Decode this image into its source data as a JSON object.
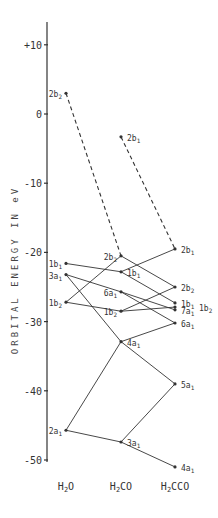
{
  "chart_data": {
    "type": "line",
    "title": "",
    "xlabel": "",
    "ylabel": "ORBITAL ENERGY IN eV",
    "ylim": [
      -52,
      13
    ],
    "yticks": [
      {
        "value": 10,
        "label": "+10"
      },
      {
        "value": 0,
        "label": "0"
      },
      {
        "value": -10,
        "label": "-10"
      },
      {
        "value": -20,
        "label": "-20"
      },
      {
        "value": -30,
        "label": "-30"
      },
      {
        "value": -40,
        "label": "-40"
      },
      {
        "value": -50,
        "label": "-50"
      }
    ],
    "categories": [
      "H2O",
      "H2CO",
      "H2CCO"
    ],
    "category_labels": [
      {
        "main": "H",
        "sub": "2",
        "rest": "O"
      },
      {
        "main": "H",
        "sub": "2",
        "rest": "CO"
      },
      {
        "main": "H",
        "sub": "2",
        "rest": "CCO"
      }
    ],
    "grid": false,
    "legend": null,
    "levels": {
      "H2O": [
        {
          "id": "2b2",
          "label": "2b",
          "sub": "2",
          "energy": 3.0,
          "label_side": "left"
        },
        {
          "id": "1b1",
          "label": "1b",
          "sub": "1",
          "energy": -21.6,
          "label_side": "left"
        },
        {
          "id": "3a1",
          "label": "3a",
          "sub": "1",
          "energy": -23.2,
          "label_side": "left"
        },
        {
          "id": "1b2",
          "label": "1b",
          "sub": "2",
          "energy": -27.2,
          "label_side": "left"
        },
        {
          "id": "2a1",
          "label": "2a",
          "sub": "1",
          "energy": -45.7,
          "label_side": "left"
        }
      ],
      "H2CO": [
        {
          "id": "2b1",
          "label": "2b",
          "sub": "1",
          "energy": -3.3,
          "label_side": "right"
        },
        {
          "id": "2b2",
          "label": "2b",
          "sub": "2",
          "energy": -20.5,
          "label_side": "left"
        },
        {
          "id": "1b1",
          "label": "1b",
          "sub": "1",
          "energy": -22.8,
          "label_side": "right"
        },
        {
          "id": "6a1",
          "label": "6a",
          "sub": "1",
          "energy": -25.7,
          "label_side": "left"
        },
        {
          "id": "1b2",
          "label": "1b",
          "sub": "2",
          "energy": -28.5,
          "label_side": "left"
        },
        {
          "id": "4a1",
          "label": "4a",
          "sub": "1",
          "energy": -32.9,
          "label_side": "right"
        },
        {
          "id": "3a1",
          "label": "3a",
          "sub": "1",
          "energy": -47.4,
          "label_side": "right"
        }
      ],
      "H2CCO": [
        {
          "id": "2b1",
          "label": "2b",
          "sub": "1",
          "energy": -19.5,
          "label_side": "right"
        },
        {
          "id": "2b2",
          "label": "2b",
          "sub": "2",
          "energy": -25.0,
          "label_side": "right"
        },
        {
          "id": "1b1",
          "label": "1b",
          "sub": "1",
          "energy": -27.3,
          "label_side": "right"
        },
        {
          "id": "1b2",
          "label": "1b",
          "sub": "2",
          "energy": -27.9,
          "label_side": "far-right"
        },
        {
          "id": "7a1",
          "label": "7a",
          "sub": "1",
          "energy": -28.3,
          "label_side": "right"
        },
        {
          "id": "6a1",
          "label": "6a",
          "sub": "1",
          "energy": -30.2,
          "label_side": "right"
        },
        {
          "id": "5a1",
          "label": "5a",
          "sub": "1",
          "energy": -39.0,
          "label_side": "right"
        },
        {
          "id": "4a1",
          "label": "4a",
          "sub": "1",
          "energy": -51.0,
          "label_side": "right"
        }
      ]
    },
    "correlations": [
      {
        "from": [
          "H2O",
          "2b2"
        ],
        "to": [
          "H2CO",
          "2b2"
        ],
        "style": "dashed"
      },
      {
        "from": [
          "H2O",
          "1b1"
        ],
        "to": [
          "H2CO",
          "1b1"
        ],
        "style": "solid"
      },
      {
        "from": [
          "H2O",
          "3a1"
        ],
        "to": [
          "H2CO",
          "6a1"
        ],
        "style": "solid"
      },
      {
        "from": [
          "H2O",
          "3a1"
        ],
        "to": [
          "H2CO",
          "4a1"
        ],
        "style": "solid"
      },
      {
        "from": [
          "H2O",
          "1b2"
        ],
        "to": [
          "H2CO",
          "2b2"
        ],
        "style": "solid"
      },
      {
        "from": [
          "H2O",
          "1b2"
        ],
        "to": [
          "H2CO",
          "1b2"
        ],
        "style": "solid"
      },
      {
        "from": [
          "H2O",
          "2a1"
        ],
        "to": [
          "H2CO",
          "4a1"
        ],
        "style": "solid"
      },
      {
        "from": [
          "H2O",
          "2a1"
        ],
        "to": [
          "H2CO",
          "3a1"
        ],
        "style": "solid"
      },
      {
        "from": [
          "H2CO",
          "2b1"
        ],
        "to": [
          "H2CCO",
          "2b1"
        ],
        "style": "dashed"
      },
      {
        "from": [
          "H2CO",
          "1b1"
        ],
        "to": [
          "H2CCO",
          "2b1"
        ],
        "style": "solid"
      },
      {
        "from": [
          "H2CO",
          "2b2"
        ],
        "to": [
          "H2CCO",
          "2b2"
        ],
        "style": "solid"
      },
      {
        "from": [
          "H2CO",
          "1b1"
        ],
        "to": [
          "H2CCO",
          "1b1"
        ],
        "style": "solid"
      },
      {
        "from": [
          "H2CO",
          "6a1"
        ],
        "to": [
          "H2CCO",
          "7a1"
        ],
        "style": "solid"
      },
      {
        "from": [
          "H2CO",
          "6a1"
        ],
        "to": [
          "H2CCO",
          "6a1"
        ],
        "style": "solid"
      },
      {
        "from": [
          "H2CO",
          "1b2"
        ],
        "to": [
          "H2CCO",
          "2b2"
        ],
        "style": "solid"
      },
      {
        "from": [
          "H2CO",
          "1b2"
        ],
        "to": [
          "H2CCO",
          "1b2"
        ],
        "style": "solid"
      },
      {
        "from": [
          "H2CO",
          "4a1"
        ],
        "to": [
          "H2CCO",
          "6a1"
        ],
        "style": "solid"
      },
      {
        "from": [
          "H2CO",
          "4a1"
        ],
        "to": [
          "H2CCO",
          "5a1"
        ],
        "style": "solid"
      },
      {
        "from": [
          "H2CO",
          "3a1"
        ],
        "to": [
          "H2CCO",
          "5a1"
        ],
        "style": "solid"
      },
      {
        "from": [
          "H2CO",
          "3a1"
        ],
        "to": [
          "H2CCO",
          "4a1"
        ],
        "style": "solid"
      }
    ]
  },
  "layout": {
    "axis_x": 47,
    "axis_top": 22,
    "axis_bottom": 462,
    "zero_y": 114,
    "px_per_ev": 6.92,
    "column_x": {
      "H2O": 66,
      "H2CO": 121,
      "H2CCO": 175
    },
    "category_label_y": 490,
    "ink_color": "#333333"
  }
}
